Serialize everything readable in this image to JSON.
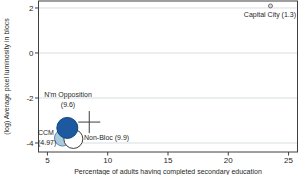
{
  "annotations": {
    "capital_city": "Capital City (1.3)",
    "nm_opposition_line1": "N'm Opposition",
    "nm_opposition_line2": "(9.6)",
    "ccm_line1": "CCM",
    "ccm_line2": "(4.97)",
    "non_bloc": "Non-Bloc (9.9)"
  },
  "chart_data": {
    "type": "scatter",
    "title": "",
    "xlabel": "Percentage of adults having completed secondary education",
    "ylabel": "(log) Average pixel luminosity in blocs",
    "xlim": [
      4.26,
      25.74
    ],
    "ylim": [
      -4.4,
      2.31
    ],
    "xticks": [
      5,
      10,
      15,
      20,
      25
    ],
    "yticks": [
      2,
      0,
      -2,
      -4
    ],
    "grid": "horizontal-at-yticks",
    "legend": "none",
    "colors": {
      "grid": "#d9dee1",
      "axis": "#3f3f3f",
      "text": "#1f1f1f"
    },
    "points": [
      {
        "label": "Capital City",
        "size_value": 1.3,
        "x": 23.5,
        "y": 2.09,
        "r_px": 2,
        "fill": "#dcdcdc",
        "stroke": "#707070"
      },
      {
        "label": "CCM",
        "size_value": 4.97,
        "x": 6.25,
        "y": -3.78,
        "r_px": 8,
        "fill": "#a9cadc",
        "stroke": "#5d87a8"
      },
      {
        "label": "Non-Bloc",
        "size_value": 9.9,
        "x": 7.15,
        "y": -3.82,
        "r_px": 9.5,
        "fill": "#ffffff",
        "stroke": "#3c3c3c"
      },
      {
        "label": "N'm Opposition",
        "size_value": 9.6,
        "x": 6.65,
        "y": -3.33,
        "r_px": 10.5,
        "fill": "#1c59a0",
        "stroke": "#10457e"
      }
    ],
    "cross_marker": {
      "x": 8.47,
      "y": -3.07,
      "half_px": 11
    }
  }
}
